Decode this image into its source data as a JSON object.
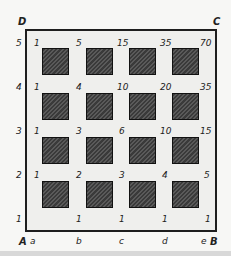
{
  "diagram": {
    "corners": {
      "A": "A",
      "B": "B",
      "C": "C",
      "D": "D"
    },
    "row_labels": [
      "1",
      "2",
      "3",
      "4",
      "5"
    ],
    "col_labels": [
      "a",
      "b",
      "c",
      "d",
      "e"
    ],
    "grid_values": [
      [
        "1",
        "5",
        "15",
        "35",
        "70"
      ],
      [
        "1",
        "4",
        "10",
        "20",
        "35"
      ],
      [
        "1",
        "3",
        "6",
        "10",
        "15"
      ],
      [
        "1",
        "2",
        "3",
        "4",
        "5"
      ],
      [
        "",
        "1",
        "1",
        "1",
        "1"
      ]
    ],
    "obstacle_blocks": {
      "rows": 4,
      "cols": 4,
      "color": "#3f3f3f"
    }
  }
}
